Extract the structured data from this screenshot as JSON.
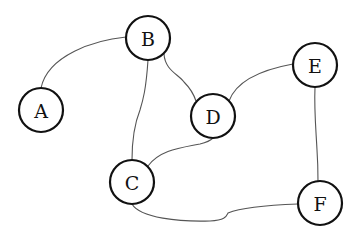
{
  "diagram": {
    "type": "undirected-graph",
    "background": "#ffffff",
    "node_stroke": "#111111",
    "edge_stroke": "#555555",
    "nodes": [
      {
        "id": "A",
        "label": "A",
        "cx": 41,
        "cy": 110,
        "r": 22
      },
      {
        "id": "B",
        "label": "B",
        "cx": 148,
        "cy": 38,
        "r": 22
      },
      {
        "id": "C",
        "label": "C",
        "cx": 132,
        "cy": 182,
        "r": 22
      },
      {
        "id": "D",
        "label": "D",
        "cx": 213,
        "cy": 116,
        "r": 22
      },
      {
        "id": "E",
        "label": "E",
        "cx": 315,
        "cy": 65,
        "r": 22
      },
      {
        "id": "F",
        "label": "F",
        "cx": 320,
        "cy": 203,
        "r": 22
      }
    ],
    "edges": [
      {
        "from": "A",
        "to": "B",
        "path": "M41,88 C48,55 95,40 126,37"
      },
      {
        "from": "B",
        "to": "C",
        "path": "M148,60 C146,90 143,100 140,110 C134,125 132,145 132,160"
      },
      {
        "from": "B",
        "to": "D",
        "path": "M164,54 C165,70 178,74 184,82 C190,88 193,92 196,101"
      },
      {
        "from": "D",
        "to": "E",
        "path": "M229,101 C236,82 260,70 293,64"
      },
      {
        "from": "E",
        "to": "F",
        "path": "M315,87 C314,110 316,130 317,150 C318,165 318,175 318,181"
      },
      {
        "from": "C",
        "to": "F",
        "path": "M132,204 C140,218 180,222 210,221 C225,220 226,217 228,213 C240,208 270,205 298,204"
      },
      {
        "from": "C",
        "to": "D",
        "path": "M148,166 C160,150 180,148 200,144 C208,142 211,140 213,138"
      }
    ]
  }
}
